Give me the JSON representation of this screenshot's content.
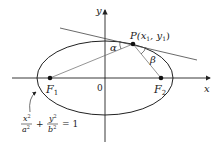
{
  "diagram": {
    "type": "ellipse-reflection-property",
    "axes": {
      "x_label": "x",
      "y_label": "y",
      "origin_label": "0"
    },
    "foci": [
      {
        "label": "F",
        "subscript": "1"
      },
      {
        "label": "F",
        "subscript": "2"
      }
    ],
    "point": {
      "label": "P(x",
      "sub1": "1",
      "mid": ", y",
      "sub2": "1",
      "close": ")"
    },
    "angles": {
      "alpha": "α",
      "beta": "β"
    },
    "equation": {
      "term1_num": "x",
      "term1_num_exp": "2",
      "term1_den": "a",
      "term1_den_exp": "2",
      "plus": "+",
      "term2_num": "y",
      "term2_num_exp": "2",
      "term2_den": "b",
      "term2_den_exp": "2",
      "equals": "= 1"
    },
    "colors": {
      "stroke": "#222222",
      "light_stroke": "#666666",
      "background": "#ffffff"
    }
  }
}
